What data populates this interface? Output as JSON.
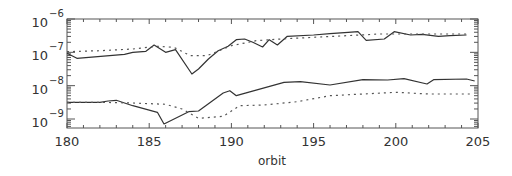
{
  "chart_data": {
    "type": "line",
    "title": "",
    "xlabel": "orbit",
    "ylabel": "",
    "xlim": [
      180,
      205
    ],
    "ylim_log10": [
      -9.27,
      -6
    ],
    "yscale": "log",
    "grid": false,
    "x_ticks": [
      180,
      185,
      190,
      195,
      200,
      205
    ],
    "x_tick_labels": [
      "180",
      "185",
      "190",
      "195",
      "200",
      "205"
    ],
    "y_ticks_log10": [
      -6,
      -7,
      -8,
      -9
    ],
    "y_tick_labels": [
      {
        "base": "10",
        "exp": "−6"
      },
      {
        "base": "10",
        "exp": "−7"
      },
      {
        "base": "10",
        "exp": "−8"
      },
      {
        "base": "10",
        "exp": "−9"
      }
    ],
    "series": [
      {
        "name": "upper-solid",
        "style": "solid",
        "x": [
          180,
          180.6,
          183.5,
          184,
          184.8,
          185.3,
          186.0,
          186.6,
          187.6,
          188.0,
          188.6,
          189.2,
          189.8,
          190.3,
          190.8,
          191.3,
          191.9,
          192.3,
          192.8,
          193.4,
          195.0,
          196.0,
          197.1,
          197.7,
          198.2,
          199.3,
          199.9,
          200.9,
          201.6,
          202.6,
          203.3,
          204.3
        ],
        "log10_values": [
          -7.03,
          -7.18,
          -7.06,
          -7.0,
          -6.97,
          -6.78,
          -7.0,
          -6.92,
          -7.65,
          -7.5,
          -7.2,
          -6.95,
          -6.82,
          -6.62,
          -6.6,
          -6.7,
          -6.84,
          -6.62,
          -6.78,
          -6.52,
          -6.48,
          -6.44,
          -6.4,
          -6.38,
          -6.64,
          -6.6,
          -6.38,
          -6.48,
          -6.46,
          -6.52,
          -6.5,
          -6.48
        ]
      },
      {
        "name": "upper-dotted",
        "style": "dotted",
        "x": [
          180,
          182,
          184,
          185.5,
          186.5,
          187.5,
          188.5,
          190,
          191.5,
          193,
          195,
          197,
          199,
          201,
          203,
          204.5
        ],
        "log10_values": [
          -6.98,
          -6.95,
          -6.9,
          -6.82,
          -6.85,
          -7.1,
          -7.1,
          -6.8,
          -6.65,
          -6.6,
          -6.55,
          -6.5,
          -6.45,
          -6.45,
          -6.45,
          -6.45
        ]
      },
      {
        "name": "lower-solid",
        "style": "solid",
        "x": [
          180,
          182,
          182.5,
          183,
          184,
          185.5,
          185.9,
          187.4,
          188.0,
          189.5,
          189.9,
          190.3,
          193.2,
          194.2,
          196.0,
          198.0,
          199.5,
          200.5,
          201.9,
          202.3,
          204.3,
          204.8
        ],
        "log10_values": [
          -8.5,
          -8.5,
          -8.46,
          -8.44,
          -8.6,
          -8.8,
          -9.15,
          -8.78,
          -8.76,
          -8.22,
          -8.15,
          -8.3,
          -7.9,
          -7.88,
          -7.98,
          -7.82,
          -7.83,
          -7.79,
          -7.95,
          -7.82,
          -7.8,
          -7.86
        ]
      },
      {
        "name": "lower-dotted",
        "style": "dotted",
        "x": [
          180,
          182,
          184,
          186,
          187,
          188,
          189.5,
          190.5,
          192,
          194,
          196,
          198,
          200,
          202,
          204.5
        ],
        "log10_values": [
          -8.5,
          -8.5,
          -8.52,
          -8.56,
          -8.7,
          -8.98,
          -8.92,
          -8.6,
          -8.58,
          -8.48,
          -8.3,
          -8.25,
          -8.2,
          -8.25,
          -8.25
        ]
      }
    ]
  }
}
